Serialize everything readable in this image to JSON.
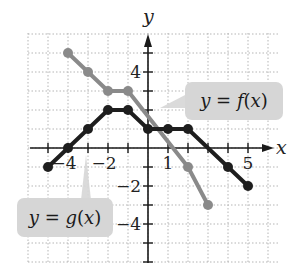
{
  "chart_data": {
    "type": "line",
    "title": "",
    "xlabel": "x",
    "ylabel": "y",
    "xlim": [
      -5.5,
      6.5
    ],
    "ylim": [
      -5.5,
      6.2
    ],
    "grid": true,
    "x_tick_labels": [
      {
        "value": -4,
        "label": "−4"
      },
      {
        "value": -2,
        "label": "−2"
      },
      {
        "value": 1,
        "label": "1"
      },
      {
        "value": 5,
        "label": "5"
      }
    ],
    "y_tick_labels": [
      {
        "value": 4,
        "label": "4"
      },
      {
        "value": -2,
        "label": "−2"
      },
      {
        "value": -4,
        "label": "−4"
      }
    ],
    "series": [
      {
        "name": "y = f(x)",
        "color": "#8a8a8a",
        "points": [
          [
            -4,
            5
          ],
          [
            -3,
            4
          ],
          [
            -2,
            3
          ],
          [
            -1,
            3
          ],
          [
            2,
            -1
          ],
          [
            3,
            -3
          ]
        ],
        "markers": [
          [
            -4,
            5
          ],
          [
            -3,
            4
          ],
          [
            -2,
            3
          ],
          [
            -1,
            3
          ],
          [
            2,
            -1
          ],
          [
            3,
            -3
          ]
        ]
      },
      {
        "name": "y = g(x)",
        "color": "#1e1e1e",
        "points": [
          [
            -5,
            -1
          ],
          [
            -4,
            0
          ],
          [
            -3,
            1
          ],
          [
            -2,
            2
          ],
          [
            -1,
            2
          ],
          [
            0,
            1
          ],
          [
            1,
            1
          ],
          [
            2,
            1
          ],
          [
            4,
            -1
          ],
          [
            5,
            -2
          ]
        ],
        "markers": [
          [
            -5,
            -1
          ],
          [
            -4,
            0
          ],
          [
            -3,
            1
          ],
          [
            -2,
            2
          ],
          [
            -1,
            2
          ],
          [
            0,
            1
          ],
          [
            1,
            1
          ],
          [
            2,
            1
          ],
          [
            4,
            -1
          ],
          [
            5,
            -2
          ]
        ]
      }
    ],
    "annotations": [
      {
        "text_prefix": "y = ",
        "func": "f",
        "text_arg": "(x)",
        "full": "y = f(x)",
        "box": [
          185,
          82,
          98,
          38
        ],
        "pointer_to": [
          160,
          108
        ]
      },
      {
        "text_prefix": "y = ",
        "func": "g",
        "text_arg": "(x)",
        "full": "y = g(x)",
        "box": [
          17,
          198,
          96,
          39
        ],
        "pointer_to": [
          86,
          155
        ]
      }
    ]
  },
  "labels": {
    "x_axis": "x",
    "y_axis": "y",
    "f_label": "y = f(x)",
    "g_label": "y = g(x)"
  },
  "style": {
    "f_color": "#8a8a8a",
    "g_color": "#1e1e1e",
    "callout_bg": "#d6d6d6",
    "grid_color": "#b5b5b5",
    "axis_color": "#1a1a1a"
  }
}
